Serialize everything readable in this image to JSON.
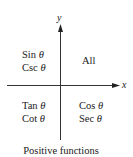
{
  "diagram": {
    "axes": {
      "x_label": "x",
      "y_label": "y"
    },
    "quadrants": {
      "q1": {
        "lines": [
          "All"
        ]
      },
      "q2": {
        "lines": [
          {
            "fn": "Sin",
            "var": "θ"
          },
          {
            "fn": "Csc",
            "var": "θ"
          }
        ]
      },
      "q3": {
        "lines": [
          {
            "fn": "Tan",
            "var": "θ"
          },
          {
            "fn": "Cot",
            "var": "θ"
          }
        ]
      },
      "q4": {
        "lines": [
          {
            "fn": "Cos",
            "var": "θ"
          },
          {
            "fn": "Sec",
            "var": "θ"
          }
        ]
      }
    },
    "caption": "Positive functions",
    "colors": {
      "ink": "#1a1a1a",
      "background": "#ffffff"
    }
  }
}
